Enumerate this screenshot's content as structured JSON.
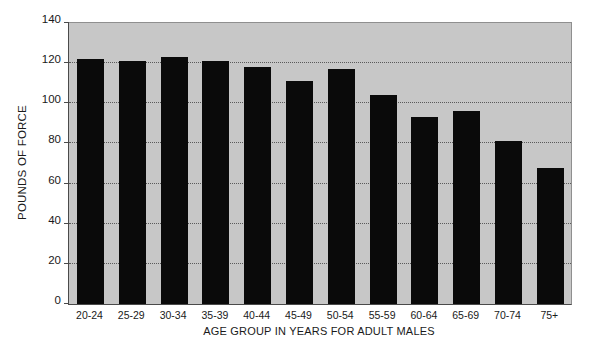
{
  "chart_data": {
    "type": "bar",
    "title": "",
    "xlabel": "AGE GROUP IN YEARS FOR ADULT MALES",
    "ylabel": "POUNDS OF FORCE",
    "categories": [
      "20-24",
      "25-29",
      "30-34",
      "35-39",
      "40-44",
      "45-49",
      "50-54",
      "55-59",
      "60-64",
      "65-69",
      "70-74",
      "75+"
    ],
    "values": [
      122,
      121,
      123,
      121,
      118,
      111,
      117,
      104,
      93,
      96,
      81,
      68
    ],
    "ylim": [
      0,
      140
    ],
    "yticks": [
      0,
      20,
      40,
      60,
      80,
      100,
      120,
      140
    ],
    "ytick_labels": [
      "0",
      "20",
      "40",
      "60",
      "80",
      "100",
      "120",
      "140"
    ],
    "grid": "horizontal-dotted",
    "legend": "none",
    "bar_color": "#0a0a0a",
    "plot_background": "#c7c7c7",
    "figure_background": "#ffffff",
    "axis_color": "#4a4a4a"
  }
}
